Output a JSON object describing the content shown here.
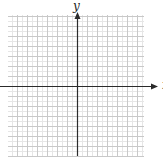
{
  "diagram": {
    "type": "coordinate-plane",
    "axes": {
      "x_label": "x",
      "y_label": "y",
      "axis_color": "#2a2a2a",
      "arrow_positive_only": true
    },
    "grid": {
      "left": 8,
      "top": 15,
      "right": 144,
      "bottom": 156,
      "origin_x": 77,
      "origin_y": 86,
      "major_spacing": 10,
      "minor_per_major": 2,
      "major_color": "#c8c8c8",
      "minor_color": "#e6e6e6"
    }
  }
}
